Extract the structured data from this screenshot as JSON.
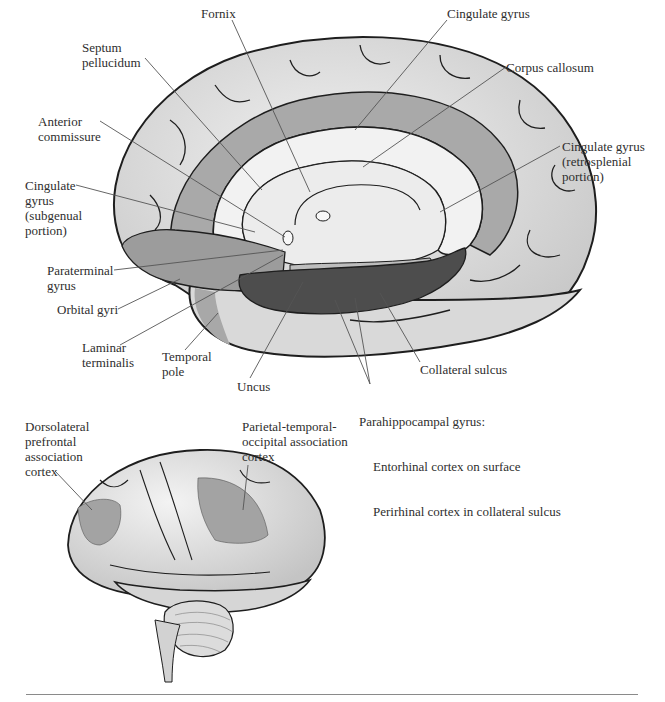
{
  "figure": {
    "panels": {
      "medial_view": {
        "name": "Medial view of right hemisphere (limbic lobe)",
        "labels": [
          {
            "id": "fornix",
            "text": "Fornix",
            "x": 201,
            "y": 13
          },
          {
            "id": "cingulate-gyrus",
            "text": "Cingulate gyrus",
            "x": 447,
            "y": 13
          },
          {
            "id": "septum-pellucidum",
            "text": "Septum\npellucidum",
            "x": 82,
            "y": 40
          },
          {
            "id": "corpus-callosum",
            "text": "Corpus callosum",
            "x": 506,
            "y": 60
          },
          {
            "id": "anterior-commissure",
            "text": "Anterior\ncommissure",
            "x": 38,
            "y": 114
          },
          {
            "id": "cingulate-retrosplenial",
            "text": "Cingulate gyrus\n(retrosplenial\nportion)",
            "x": 562,
            "y": 139
          },
          {
            "id": "cingulate-subgenual",
            "text": "Cingulate\ngyrus\n(subgenual\nportion)",
            "x": 25,
            "y": 178
          },
          {
            "id": "paraterminal-gyrus",
            "text": "Paraterminal\ngyrus",
            "x": 47,
            "y": 263
          },
          {
            "id": "orbital-gyri",
            "text": "Orbital gyri",
            "x": 57,
            "y": 302
          },
          {
            "id": "laminar-terminalis",
            "text": "Laminar\nterminalis",
            "x": 82,
            "y": 340
          },
          {
            "id": "temporal-pole",
            "text": "Temporal\npole",
            "x": 162,
            "y": 349
          },
          {
            "id": "uncus",
            "text": "Uncus",
            "x": 237,
            "y": 379
          },
          {
            "id": "collateral-sulcus",
            "text": "Collateral sulcus",
            "x": 420,
            "y": 362
          }
        ],
        "parahippocampal": {
          "title": "Parahippocampal gyrus:",
          "lines": [
            "Entorhinal cortex on surface",
            "Perirhinal cortex in collateral sulcus"
          ],
          "x": 359,
          "y": 384
        }
      },
      "lateral_view": {
        "name": "Lateral view of left hemisphere",
        "labels": [
          {
            "id": "dorsolateral-prefrontal",
            "text": "Dorsolateral\nprefrontal\nassociation\ncortex",
            "x": 25,
            "y": 419
          },
          {
            "id": "parietal-temporal-occipital",
            "text": "Parietal-temporal-\noccipital association\ncortex",
            "x": 242,
            "y": 419
          }
        ]
      }
    },
    "colors": {
      "background": "#ffffff",
      "cortex_light": "#e3e3e3",
      "cortex_mid": "#cfcfcf",
      "outline": "#1e1e1e",
      "limbic_shade": "#9c9c9c",
      "cingulate_band": "#a9a9a9",
      "corpus_callosum": "#f2f2f2",
      "parahippocampal_dark": "#4d4d4d",
      "association_shade": "#a3a3a3",
      "leader_line": "#555555",
      "rule": "#8a8a8a"
    }
  }
}
